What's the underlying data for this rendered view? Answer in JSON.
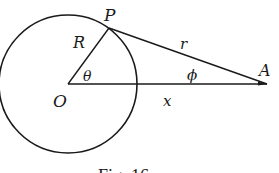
{
  "diagram": {
    "type": "geometry",
    "points": {
      "O": {
        "label": "O",
        "x": 68,
        "y": 84
      },
      "P": {
        "label": "P",
        "x": 109,
        "y": 28
      },
      "A": {
        "label": "A",
        "x": 267,
        "y": 84
      }
    },
    "circle": {
      "center": "O",
      "radius_px": 69
    },
    "segments": [
      {
        "from": "O",
        "to": "P",
        "label": "R"
      },
      {
        "from": "P",
        "to": "A",
        "label": "r"
      },
      {
        "from": "O",
        "to": "A",
        "label": "x"
      }
    ],
    "angles": [
      {
        "vertex": "O",
        "label": "θ"
      },
      {
        "vertex": "A",
        "label": "ϕ"
      }
    ],
    "labels": {
      "P": "P",
      "R": "R",
      "r": "r",
      "theta": "θ",
      "phi": "ϕ",
      "A": "A",
      "O": "O",
      "x": "x"
    },
    "caption": "Fig. 16",
    "line_color": "#1a1a1a"
  }
}
